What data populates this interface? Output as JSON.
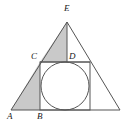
{
  "figure": {
    "background_color": "#ffffff",
    "stroke_color": "#555555",
    "shade_color": "#c9c9c9",
    "label_color": "#202020",
    "canvas": {
      "width": 126,
      "height": 128
    }
  },
  "labels": {
    "apex": "E",
    "left_base": "A",
    "square_base_left": "B",
    "square_top_left": "C",
    "median_top": "D"
  },
  "geometry": {
    "outer_triangle": {
      "name": "triangle-AE-right",
      "points": "11,110 67,22 120,110"
    },
    "square": {
      "name": "inscribed-square",
      "x": 40,
      "y": 62,
      "width": 50,
      "height": 48
    },
    "circle": {
      "name": "inscribed-circle",
      "cx": 65,
      "cy": 86,
      "r": 24
    },
    "median_line": {
      "name": "apex-vertical",
      "x1": 67,
      "y1": 22,
      "x2": 67,
      "y2": 62
    },
    "chord_line": {
      "name": "line-CD",
      "x1": 40,
      "y1": 62,
      "x2": 90,
      "y2": 62
    },
    "shaded_left": {
      "name": "shaded-region-ABC",
      "points": "11,110 40,110 40,62"
    },
    "shaded_apex": {
      "name": "shaded-region-CED",
      "points": "40,62 67,22 67,62"
    }
  },
  "label_positions": {
    "apex": {
      "left": 64,
      "top": 4
    },
    "left_base": {
      "left": 7,
      "top": 113
    },
    "square_base_left": {
      "left": 37,
      "top": 113
    },
    "square_top_left": {
      "left": 31,
      "top": 52
    },
    "median_top": {
      "left": 69,
      "top": 52
    }
  }
}
